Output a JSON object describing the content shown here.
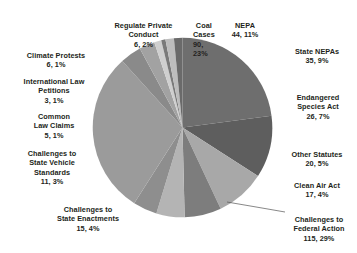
{
  "chart_data": {
    "type": "pie",
    "title": "",
    "subtitle": "",
    "xlabel": "",
    "ylabel": "",
    "legend_position": "none",
    "grid": false,
    "label_format": "count, percent",
    "total": 399,
    "start_angle_deg": 0,
    "direction": "clockwise",
    "categories": [
      "Coal Cases",
      "NEPA",
      "State NEPAs",
      "Endangered Species Act",
      "Other Statutes",
      "Clean Air Act",
      "Challenges to Federal Action",
      "Challenges to State Enactments",
      "Challenges to State Vehicle Standards",
      "Common Law Claims",
      "International Law Petitions",
      "Climate Protests",
      "Regulate Private Conduct"
    ],
    "values": [
      90,
      44,
      35,
      26,
      20,
      17,
      115,
      15,
      11,
      5,
      3,
      6,
      6
    ],
    "percents": [
      23,
      11,
      9,
      7,
      5,
      4,
      29,
      4,
      3,
      1,
      1,
      1,
      2
    ],
    "colors": [
      "#6e6e6e",
      "#5e5e5e",
      "#a8a8a8",
      "#7d7d7d",
      "#b4b4b4",
      "#8e8e8e",
      "#9b9b9b",
      "#8a8a8a",
      "#a2a2a2",
      "#cfcfcf",
      "#7a7a7a",
      "#bdbdbd",
      "#6a6a6a"
    ],
    "slices": [
      {
        "name": "Coal Cases",
        "value": 90,
        "percent": 23,
        "color": "#6e6e6e"
      },
      {
        "name": "NEPA",
        "value": 44,
        "percent": 11,
        "color": "#5e5e5e"
      },
      {
        "name": "State NEPAs",
        "value": 35,
        "percent": 9,
        "color": "#a8a8a8"
      },
      {
        "name": "Endangered Species Act",
        "value": 26,
        "percent": 7,
        "color": "#7d7d7d"
      },
      {
        "name": "Other Statutes",
        "value": 20,
        "percent": 5,
        "color": "#b4b4b4"
      },
      {
        "name": "Clean Air Act",
        "value": 17,
        "percent": 4,
        "color": "#8e8e8e"
      },
      {
        "name": "Challenges to Federal Action",
        "value": 115,
        "percent": 29,
        "color": "#9b9b9b"
      },
      {
        "name": "Challenges to State Enactments",
        "value": 15,
        "percent": 4,
        "color": "#8a8a8a"
      },
      {
        "name": "Challenges to State Vehicle Standards",
        "value": 11,
        "percent": 3,
        "color": "#a2a2a2"
      },
      {
        "name": "Common Law Claims",
        "value": 5,
        "percent": 1,
        "color": "#cfcfcf"
      },
      {
        "name": "International Law Petitions",
        "value": 3,
        "percent": 1,
        "color": "#7a7a7a"
      },
      {
        "name": "Climate Protests",
        "value": 6,
        "percent": 1,
        "color": "#bdbdbd"
      },
      {
        "name": "Regulate Private Conduct",
        "value": 6,
        "percent": 2,
        "color": "#6a6a6a"
      }
    ]
  },
  "labels": {
    "coal_cases": {
      "name": "Coal Cases",
      "value": "90, 23%"
    },
    "nepa": {
      "name": "NEPA",
      "value": "44, 11%"
    },
    "state_nepas": {
      "name": "State NEPAs",
      "value": "35, 9%"
    },
    "endangered": {
      "name": "Endangered\nSpecies Act",
      "value": "26, 7%"
    },
    "other_statutes": {
      "name": "Other Statutes",
      "value": "20, 5%"
    },
    "clean_air": {
      "name": "Clean Air Act",
      "value": "17, 4%"
    },
    "federal_action": {
      "name": "Challenges to\nFederal Action",
      "value": "115, 29%"
    },
    "state_enactments": {
      "name": "Challenges to\nState Enactments",
      "value": "15, 4%"
    },
    "vehicle_standards": {
      "name": "Challenges to\nState Vehicle\nStandards",
      "value": "11, 3%"
    },
    "common_law": {
      "name": "Common\nLaw Claims",
      "value": "5, 1%"
    },
    "intl_law": {
      "name": "International Law\nPetitions",
      "value": "3, 1%"
    },
    "climate_protests": {
      "name": "Climate Protests",
      "value": "6, 1%"
    },
    "regulate_private": {
      "name": "Regulate Private\nConduct",
      "value": "6, 2%"
    }
  },
  "style": {
    "text_color": "#231f20",
    "background": "#ffffff",
    "leader_line_color": "#555555"
  }
}
